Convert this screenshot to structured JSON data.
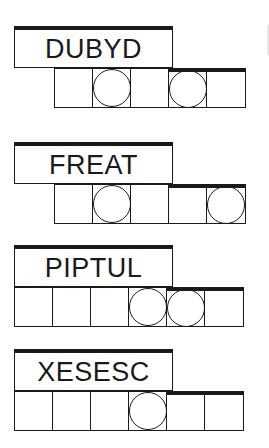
{
  "puzzles": [
    {
      "scrambled": "DUBYD",
      "top": 26,
      "cells_left": 54,
      "cell_count": 5,
      "circled": [
        2,
        4
      ],
      "thick_from": 3
    },
    {
      "scrambled": "FREAT",
      "top": 142,
      "cells_left": 54,
      "cell_count": 5,
      "circled": [
        2,
        5
      ],
      "thick_from": 3
    },
    {
      "scrambled": "PIPTUL",
      "top": 245,
      "cells_left": 14,
      "cell_count": 6,
      "circled": [
        4,
        5
      ],
      "thick_from": 4
    },
    {
      "scrambled": "XESESC",
      "top": 349,
      "cells_left": 14,
      "cell_count": 6,
      "circled": [
        4
      ],
      "thick_from": 4
    }
  ],
  "colors": {
    "ink": "#1a1a1a",
    "background": "#ffffff"
  }
}
